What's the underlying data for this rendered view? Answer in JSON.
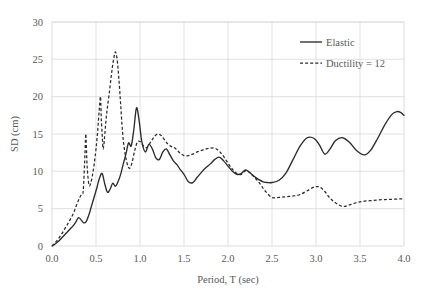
{
  "chart_data": {
    "type": "line",
    "title": "",
    "xlabel": "Period, T (sec)",
    "ylabel": "SD (cm)",
    "xlim": [
      0.0,
      4.0
    ],
    "ylim": [
      0,
      30
    ],
    "xticks": [
      "0.0",
      "0.5",
      "1.0",
      "1.5",
      "2.0",
      "2.5",
      "3.0",
      "3.5",
      "4.0"
    ],
    "xtick_values": [
      0.0,
      0.5,
      1.0,
      1.5,
      2.0,
      2.5,
      3.0,
      3.5,
      4.0
    ],
    "yticks": [
      "0",
      "5",
      "10",
      "15",
      "20",
      "25",
      "30"
    ],
    "ytick_values": [
      0,
      5,
      10,
      15,
      20,
      25,
      30
    ],
    "grid": true,
    "grid_color": "#d9d9d9",
    "legend_position": "top-right",
    "series": [
      {
        "name": "Elastic",
        "style": "solid",
        "color": "#2b2b2b",
        "x": [
          0.0,
          0.04,
          0.08,
          0.12,
          0.16,
          0.2,
          0.24,
          0.27,
          0.3,
          0.33,
          0.36,
          0.39,
          0.42,
          0.45,
          0.48,
          0.51,
          0.54,
          0.57,
          0.6,
          0.63,
          0.66,
          0.69,
          0.72,
          0.75,
          0.78,
          0.81,
          0.84,
          0.87,
          0.9,
          0.93,
          0.96,
          0.99,
          1.02,
          1.06,
          1.1,
          1.14,
          1.18,
          1.22,
          1.26,
          1.3,
          1.34,
          1.38,
          1.42,
          1.46,
          1.5,
          1.55,
          1.6,
          1.65,
          1.7,
          1.75,
          1.8,
          1.85,
          1.9,
          1.95,
          2.0,
          2.05,
          2.1,
          2.15,
          2.2,
          2.25,
          2.3,
          2.35,
          2.4,
          2.45,
          2.5,
          2.58,
          2.66,
          2.74,
          2.82,
          2.9,
          2.98,
          3.04,
          3.1,
          3.16,
          3.22,
          3.3,
          3.38,
          3.46,
          3.55,
          3.62,
          3.7,
          3.78,
          3.86,
          3.92,
          3.96,
          4.0
        ],
        "y": [
          0.0,
          0.3,
          0.7,
          1.2,
          1.7,
          2.2,
          2.7,
          3.2,
          3.8,
          3.5,
          3.1,
          3.3,
          4.2,
          5.4,
          6.6,
          7.8,
          9.1,
          9.7,
          8.3,
          7.2,
          7.6,
          8.4,
          8.0,
          8.6,
          9.6,
          11.0,
          12.3,
          13.8,
          13.4,
          15.6,
          18.5,
          16.8,
          14.0,
          12.6,
          13.6,
          13.0,
          11.8,
          11.6,
          12.6,
          13.0,
          12.2,
          11.4,
          10.9,
          10.2,
          9.6,
          8.6,
          8.5,
          9.2,
          9.9,
          10.5,
          11.0,
          11.6,
          11.9,
          11.4,
          10.7,
          10.0,
          9.6,
          9.7,
          10.2,
          9.8,
          9.3,
          8.9,
          8.6,
          8.5,
          8.5,
          8.8,
          9.8,
          11.6,
          13.4,
          14.5,
          14.4,
          13.5,
          12.3,
          13.0,
          14.1,
          14.5,
          13.9,
          12.8,
          12.2,
          12.8,
          14.4,
          16.2,
          17.6,
          18.0,
          17.9,
          17.5
        ]
      },
      {
        "name": "Ductility = 12",
        "style": "dashed",
        "color": "#2b2b2b",
        "x": [
          0.0,
          0.04,
          0.08,
          0.12,
          0.16,
          0.2,
          0.24,
          0.27,
          0.3,
          0.32,
          0.34,
          0.355,
          0.37,
          0.38,
          0.385,
          0.39,
          0.4,
          0.42,
          0.44,
          0.46,
          0.48,
          0.5,
          0.52,
          0.535,
          0.55,
          0.555,
          0.56,
          0.57,
          0.575,
          0.58,
          0.59,
          0.6,
          0.62,
          0.65,
          0.68,
          0.7,
          0.72,
          0.74,
          0.76,
          0.78,
          0.8,
          0.82,
          0.85,
          0.88,
          0.91,
          0.94,
          0.97,
          1.0,
          1.04,
          1.08,
          1.12,
          1.16,
          1.2,
          1.24,
          1.28,
          1.32,
          1.36,
          1.4,
          1.45,
          1.5,
          1.55,
          1.6,
          1.65,
          1.7,
          1.75,
          1.8,
          1.85,
          1.9,
          1.95,
          2.0,
          2.05,
          2.1,
          2.15,
          2.2,
          2.25,
          2.3,
          2.36,
          2.42,
          2.5,
          2.58,
          2.66,
          2.74,
          2.82,
          2.9,
          2.98,
          3.04,
          3.1,
          3.16,
          3.22,
          3.3,
          3.38,
          3.46,
          3.55,
          3.65,
          3.75,
          3.85,
          3.95,
          4.0
        ],
        "y": [
          0.0,
          0.5,
          1.1,
          1.8,
          2.6,
          3.4,
          4.3,
          5.2,
          6.1,
          6.6,
          7.0,
          7.4,
          11.0,
          14.2,
          15.0,
          13.5,
          10.5,
          8.2,
          8.4,
          9.5,
          11.0,
          13.0,
          15.5,
          18.0,
          20.0,
          19.0,
          17.0,
          15.0,
          13.9,
          13.0,
          13.6,
          15.0,
          17.6,
          20.4,
          23.4,
          25.0,
          26.0,
          25.0,
          22.4,
          19.0,
          15.5,
          13.2,
          11.2,
          10.4,
          11.2,
          12.8,
          13.9,
          14.0,
          13.4,
          13.2,
          13.9,
          14.6,
          15.0,
          14.8,
          14.2,
          13.6,
          13.3,
          13.1,
          12.5,
          12.1,
          12.1,
          12.3,
          12.6,
          12.8,
          13.0,
          13.1,
          13.1,
          12.7,
          12.0,
          11.1,
          10.3,
          9.7,
          9.6,
          10.1,
          9.8,
          9.2,
          8.4,
          7.4,
          6.5,
          6.5,
          6.6,
          6.7,
          6.9,
          7.4,
          7.9,
          7.9,
          7.3,
          6.4,
          5.8,
          5.3,
          5.5,
          5.8,
          6.0,
          6.1,
          6.2,
          6.25,
          6.3,
          6.35
        ]
      }
    ]
  },
  "legend": {
    "entries": [
      {
        "label": "Elastic",
        "style": "solid"
      },
      {
        "label": "Ductility = 12",
        "style": "dashed"
      }
    ]
  }
}
